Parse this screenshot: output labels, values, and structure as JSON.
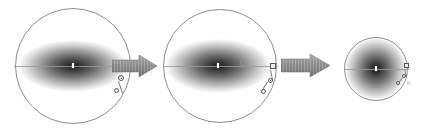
{
  "figure": {
    "title": "Gravitational collapse sequence",
    "background_color": "#ffffff",
    "outline_color": "#8e8e8e",
    "cloud_color": "#3a3a3a",
    "arrow_color": "#8a8a8a",
    "marker_color": "#555555",
    "core_color": "#ffffff"
  },
  "panels": [
    {
      "id": "panel-1",
      "label": "Stage 1 — extended flattened cloud",
      "sphere": {
        "cx": 73,
        "cy": 66,
        "r": 58
      },
      "cloud": {
        "cx": 73,
        "cy": 66,
        "rx": 55,
        "ry": 26
      },
      "core": {
        "cx": 73,
        "cy": 66,
        "w": 2,
        "h": 5
      },
      "axis": {
        "x1": 14,
        "x2": 132,
        "y": 66
      },
      "markers": [
        {
          "name": "marker-orbit-primary",
          "type": "circle",
          "cx": 121,
          "cy": 78,
          "d": 6
        },
        {
          "name": "marker-orbit-secondary",
          "type": "circle",
          "cx": 117,
          "cy": 91,
          "d": 5
        }
      ],
      "glyphs": []
    },
    {
      "id": "panel-2",
      "label": "Stage 2 — contracting cloud",
      "sphere": {
        "cx": 220,
        "cy": 66,
        "r": 57
      },
      "cloud": {
        "cx": 218,
        "cy": 66,
        "rx": 53,
        "ry": 27
      },
      "core": {
        "cx": 218,
        "cy": 66,
        "w": 2,
        "h": 5
      },
      "axis": {
        "x1": 163,
        "x2": 278,
        "y": 66
      },
      "markers": [
        {
          "name": "marker-orbit-node",
          "type": "square",
          "cx": 273,
          "cy": 66,
          "d": 6
        },
        {
          "name": "marker-orbit-primary",
          "type": "circle",
          "cx": 270,
          "cy": 80,
          "d": 5
        },
        {
          "name": "marker-orbit-secondary",
          "type": "circle",
          "cx": 263,
          "cy": 91,
          "d": 5
        }
      ],
      "glyphs": [
        {
          "name": "glyph-g",
          "text": "G",
          "x": 243,
          "y": 61,
          "size": 8
        }
      ]
    },
    {
      "id": "panel-3",
      "label": "Stage 3 — collapsed spherical core",
      "sphere": {
        "cx": 376,
        "cy": 69,
        "r": 32
      },
      "cloud": {
        "cx": 376,
        "cy": 69,
        "rx": 31,
        "ry": 30
      },
      "core": {
        "cx": 376,
        "cy": 69,
        "w": 2,
        "h": 5
      },
      "axis": {
        "x1": 344,
        "x2": 409,
        "y": 69
      },
      "markers": [
        {
          "name": "marker-orbit-node",
          "type": "square",
          "cx": 406,
          "cy": 66,
          "d": 5
        },
        {
          "name": "marker-orbit-primary",
          "type": "circle",
          "cx": 404,
          "cy": 76,
          "d": 4
        },
        {
          "name": "marker-orbit-secondary",
          "type": "circle",
          "cx": 398,
          "cy": 83,
          "d": 4
        }
      ],
      "glyphs": [
        {
          "name": "glyph-tail",
          "text": "b",
          "x": 408,
          "y": 84,
          "size": 7
        }
      ]
    }
  ],
  "arrows": [
    {
      "name": "transition-arrow-1",
      "x": 112,
      "y": 55,
      "w": 45,
      "h": 22,
      "label": "collapse step 1"
    },
    {
      "name": "transition-arrow-2",
      "x": 281,
      "y": 54,
      "w": 49,
      "h": 23,
      "label": "collapse step 2"
    }
  ]
}
